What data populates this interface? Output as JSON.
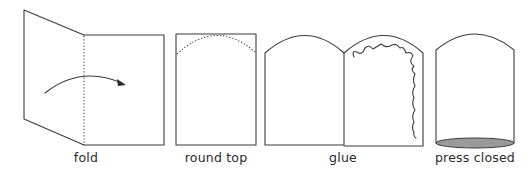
{
  "diagram": {
    "steps": [
      {
        "id": "fold",
        "label": "fold",
        "center_x": 86
      },
      {
        "id": "round-top",
        "label": "round top",
        "center_x": 216
      },
      {
        "id": "glue",
        "label": "glue",
        "center_x": 343
      },
      {
        "id": "press-closed",
        "label": "press closed",
        "center_x": 475
      }
    ],
    "colors": {
      "stroke": "#3a3a3a",
      "press_fill": "#9a9a9a",
      "background": "#ffffff"
    }
  }
}
